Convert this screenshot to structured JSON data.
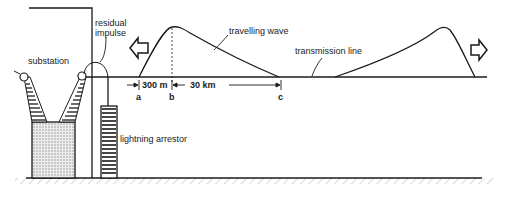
{
  "diagram": {
    "labels": {
      "substation": "substation",
      "residual_impulse_line1": "residual",
      "residual_impulse_line2": "impulse",
      "travelling_wave": "travelling wave",
      "transmission_line": "transmission line",
      "lightning_arrestor": "lightning arrestor"
    },
    "dimensions": {
      "front_length": "300 m",
      "tail_length": "30 km"
    },
    "points": {
      "a": "a",
      "b": "b",
      "c": "c"
    },
    "colors": {
      "ink": "#1a1a1a",
      "fill_stipple": "#d9d9d9",
      "background": "#ffffff"
    }
  }
}
